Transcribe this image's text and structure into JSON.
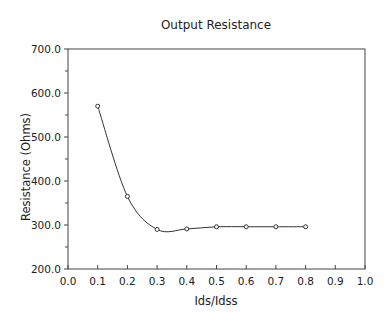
{
  "chart_data": {
    "type": "line",
    "title": "Output Resistance",
    "xlabel": "Ids/Idss",
    "ylabel": "Resistance (Ohms)",
    "xlim": [
      0.0,
      1.0
    ],
    "ylim": [
      200.0,
      700.0
    ],
    "x_ticks": [
      "0.0",
      "0.1",
      "0.2",
      "0.3",
      "0.4",
      "0.5",
      "0.6",
      "0.7",
      "0.8",
      "0.9",
      "1.0"
    ],
    "y_ticks": [
      "200.0",
      "300.0",
      "400.0",
      "500.0",
      "600.0",
      "700.0"
    ],
    "grid": false,
    "legend": null,
    "series": [
      {
        "name": "Output Resistance",
        "marker": "open-circle",
        "smooth": true,
        "x": [
          0.1,
          0.2,
          0.3,
          0.4,
          0.5,
          0.6,
          0.7,
          0.8
        ],
        "y": [
          570,
          365,
          290,
          291,
          296,
          296,
          296,
          296
        ]
      }
    ]
  }
}
